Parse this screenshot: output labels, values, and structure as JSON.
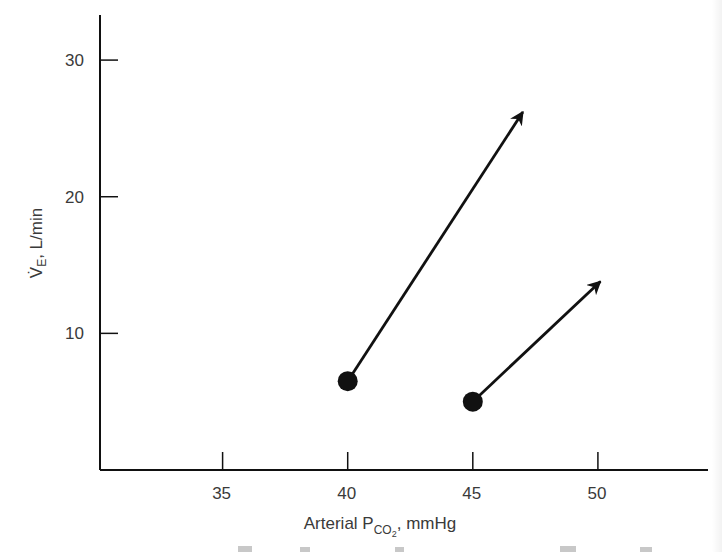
{
  "chart_data": {
    "type": "scatter",
    "title": "",
    "xlabel": "Arterial P",
    "xlabel_subscript": "CO",
    "xlabel_subscript2": "2",
    "xlabel_suffix": ", mmHg",
    "ylabel": "V̇",
    "ylabel_subscript": "E",
    "ylabel_suffix": ", L/min",
    "xlim": [
      30.1,
      54.4
    ],
    "ylim": [
      0,
      33.3
    ],
    "xticks": [
      35,
      40,
      45,
      50
    ],
    "xtick_labels": [
      "35",
      "40",
      "45",
      "50"
    ],
    "yticks": [
      10,
      20,
      30
    ],
    "ytick_labels": [
      "10",
      "20",
      "30"
    ],
    "grid": false,
    "legend": "none",
    "series": [
      {
        "name": "point-1",
        "start": {
          "x": 40,
          "y": 6.5
        },
        "arrow_end": {
          "x": 47.0,
          "y": 26.2
        }
      },
      {
        "name": "point-2",
        "start": {
          "x": 45,
          "y": 5.0
        },
        "arrow_end": {
          "x": 50.1,
          "y": 13.8
        }
      }
    ],
    "colors": {
      "ink": "#111111",
      "text": "#3a3a3a"
    }
  }
}
